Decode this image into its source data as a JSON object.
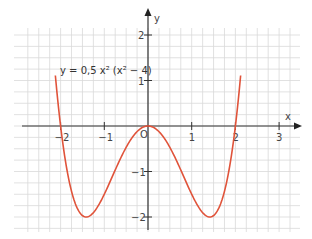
{
  "chart_data": {
    "type": "line",
    "title": "",
    "function_label": "y = 0,5 x² (x² − 4)",
    "xlabel": "x",
    "ylabel": "y",
    "xlim": [
      -2.5,
      3.3
    ],
    "ylim": [
      -2.4,
      2.4
    ],
    "x_ticks": [
      -2,
      -1,
      0,
      1,
      2,
      3
    ],
    "x_tick_labels": [
      "−2",
      "−1",
      "O",
      "1",
      "2",
      "3"
    ],
    "y_ticks": [
      -2,
      -1,
      1,
      2
    ],
    "y_tick_labels": [
      "−2",
      "−1",
      "1",
      "2"
    ],
    "origin_label": "O",
    "grid": true,
    "grid_step": 0.25,
    "legend": null,
    "series": [
      {
        "name": "y = 0,5 x² (x² − 4)",
        "color": "#e0533a",
        "domain": [
          -2.12,
          2.12
        ],
        "x": [
          -2.12,
          -2.0,
          -1.75,
          -1.5,
          -1.414,
          -1.25,
          -1.0,
          -0.75,
          -0.5,
          -0.25,
          0,
          0.25,
          0.5,
          0.75,
          1.0,
          1.25,
          1.414,
          1.5,
          1.75,
          2.0,
          2.12
        ],
        "y": [
          1.14,
          0,
          -1.53,
          -1.97,
          -2.0,
          -1.9,
          -1.5,
          -0.97,
          -0.47,
          -0.12,
          0,
          -0.12,
          -0.47,
          -0.97,
          -1.5,
          -1.9,
          -2.0,
          -1.97,
          -1.53,
          0,
          1.14
        ]
      }
    ],
    "key_points": {
      "roots": [
        -2,
        0,
        2
      ],
      "minima": [
        [
          -1.414,
          -2
        ],
        [
          1.414,
          -2
        ]
      ],
      "local_max": [
        0,
        0
      ]
    }
  },
  "colors": {
    "curve": "#e0533a",
    "axis": "#333333",
    "grid": "#d9d9d9"
  }
}
